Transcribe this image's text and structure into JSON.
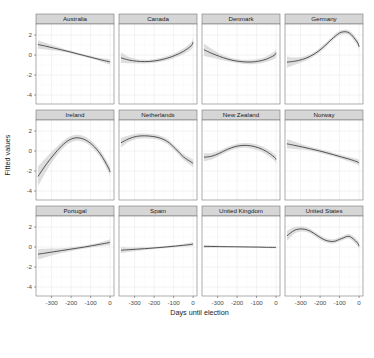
{
  "chart_data": {
    "type": "line",
    "title": "",
    "subtitle": "",
    "xlabel": "Days until election",
    "ylabel": "Fitted values",
    "xlim": [
      -380,
      20
    ],
    "ylim": [
      -4.9,
      3.1
    ],
    "xticks": [
      -300,
      -200,
      -100,
      0
    ],
    "xtick_labels": [
      "-300",
      "-200",
      "-100",
      "0"
    ],
    "yticks": [
      -4,
      -2,
      0,
      2
    ],
    "ytick_labels": [
      "-4",
      "-2",
      "0",
      "2"
    ],
    "grid": true,
    "legend": "none",
    "facet_layout": {
      "rows": 3,
      "cols": 4
    },
    "band_description": "shaded 95% confidence ribbon around each fitted smooth line",
    "line_color": "#3a3a3a",
    "ribbon_color": "#c9c9c9",
    "strip_color": "#d6d6d6",
    "panels": [
      {
        "name": "Australia",
        "row": 0,
        "col": 0,
        "x": [
          -370,
          -330,
          -290,
          -250,
          -210,
          -170,
          -130,
          -90,
          -50,
          -10,
          0
        ],
        "fit": [
          1.05,
          0.88,
          0.7,
          0.52,
          0.33,
          0.13,
          -0.07,
          -0.27,
          -0.47,
          -0.65,
          -0.7
        ],
        "lower": [
          0.62,
          0.55,
          0.46,
          0.34,
          0.19,
          0.0,
          -0.2,
          -0.41,
          -0.64,
          -0.9,
          -0.98
        ],
        "upper": [
          1.48,
          1.21,
          0.94,
          0.7,
          0.47,
          0.26,
          0.06,
          -0.13,
          -0.3,
          -0.4,
          -0.42
        ]
      },
      {
        "name": "Canada",
        "row": 0,
        "col": 1,
        "x": [
          -370,
          -330,
          -290,
          -250,
          -210,
          -170,
          -130,
          -90,
          -50,
          -10,
          0
        ],
        "fit": [
          -0.28,
          -0.5,
          -0.62,
          -0.66,
          -0.62,
          -0.5,
          -0.3,
          -0.02,
          0.36,
          0.92,
          1.3
        ],
        "lower": [
          -0.8,
          -0.82,
          -0.84,
          -0.84,
          -0.8,
          -0.7,
          -0.52,
          -0.26,
          0.08,
          0.56,
          0.86
        ],
        "upper": [
          0.24,
          -0.18,
          -0.4,
          -0.48,
          -0.44,
          -0.3,
          -0.08,
          0.22,
          0.64,
          1.28,
          1.74
        ]
      },
      {
        "name": "Denmark",
        "row": 0,
        "col": 2,
        "x": [
          -370,
          -330,
          -290,
          -250,
          -210,
          -170,
          -130,
          -90,
          -50,
          -10,
          0
        ],
        "fit": [
          0.52,
          0.16,
          -0.14,
          -0.4,
          -0.58,
          -0.68,
          -0.7,
          -0.62,
          -0.42,
          -0.04,
          0.22
        ],
        "lower": [
          -0.1,
          -0.28,
          -0.44,
          -0.62,
          -0.78,
          -0.88,
          -0.92,
          -0.86,
          -0.7,
          -0.4,
          -0.18
        ],
        "upper": [
          1.14,
          0.6,
          0.16,
          -0.18,
          -0.38,
          -0.48,
          -0.48,
          -0.38,
          -0.14,
          0.32,
          0.62
        ]
      },
      {
        "name": "Germany",
        "row": 0,
        "col": 3,
        "x": [
          -370,
          -330,
          -290,
          -250,
          -210,
          -170,
          -130,
          -90,
          -50,
          -10,
          0
        ],
        "fit": [
          -0.72,
          -0.62,
          -0.44,
          -0.12,
          0.36,
          1.02,
          1.76,
          2.28,
          2.2,
          1.3,
          0.82
        ],
        "lower": [
          -1.3,
          -0.98,
          -0.7,
          -0.34,
          0.14,
          0.8,
          1.54,
          2.06,
          1.96,
          1.0,
          0.48
        ],
        "upper": [
          -0.14,
          -0.26,
          -0.18,
          0.1,
          0.58,
          1.24,
          1.98,
          2.5,
          2.44,
          1.6,
          1.16
        ]
      },
      {
        "name": "Ireland",
        "row": 1,
        "col": 0,
        "x": [
          -370,
          -330,
          -290,
          -250,
          -210,
          -170,
          -130,
          -90,
          -50,
          -10,
          0
        ],
        "fit": [
          -2.55,
          -1.4,
          -0.4,
          0.48,
          1.1,
          1.32,
          1.14,
          0.6,
          -0.3,
          -1.62,
          -2.1
        ],
        "lower": [
          -3.55,
          -2.1,
          -0.9,
          0.1,
          0.78,
          1.02,
          0.84,
          0.28,
          -0.64,
          -2.05,
          -2.58
        ],
        "upper": [
          -1.55,
          -0.7,
          0.1,
          0.86,
          1.42,
          1.62,
          1.44,
          0.92,
          0.04,
          -1.19,
          -1.62
        ]
      },
      {
        "name": "Netherlands",
        "row": 1,
        "col": 1,
        "x": [
          -370,
          -330,
          -290,
          -250,
          -210,
          -170,
          -130,
          -90,
          -50,
          -10,
          0
        ],
        "fit": [
          0.82,
          1.22,
          1.46,
          1.52,
          1.46,
          1.3,
          0.92,
          0.22,
          -0.58,
          -1.1,
          -1.22
        ],
        "lower": [
          0.34,
          0.9,
          1.2,
          1.28,
          1.22,
          1.06,
          0.66,
          -0.04,
          -0.88,
          -1.46,
          -1.6
        ],
        "upper": [
          1.3,
          1.54,
          1.72,
          1.76,
          1.7,
          1.54,
          1.18,
          0.48,
          -0.28,
          -0.74,
          -0.84
        ]
      },
      {
        "name": "New Zealand",
        "row": 1,
        "col": 2,
        "x": [
          -370,
          -330,
          -290,
          -250,
          -210,
          -170,
          -130,
          -90,
          -50,
          -10,
          0
        ],
        "fit": [
          -0.62,
          -0.52,
          -0.22,
          0.16,
          0.44,
          0.56,
          0.52,
          0.32,
          -0.04,
          -0.6,
          -0.86
        ],
        "lower": [
          -1.02,
          -0.84,
          -0.48,
          -0.08,
          0.2,
          0.32,
          0.26,
          0.04,
          -0.34,
          -0.96,
          -1.26
        ],
        "upper": [
          -0.22,
          -0.2,
          0.04,
          0.4,
          0.68,
          0.8,
          0.78,
          0.6,
          0.26,
          -0.24,
          -0.46
        ]
      },
      {
        "name": "Norway",
        "row": 1,
        "col": 3,
        "x": [
          -370,
          -330,
          -290,
          -250,
          -210,
          -170,
          -130,
          -90,
          -50,
          -10,
          0
        ],
        "fit": [
          0.72,
          0.56,
          0.4,
          0.22,
          0.04,
          -0.16,
          -0.38,
          -0.6,
          -0.82,
          -1.08,
          -1.2
        ],
        "lower": [
          0.24,
          0.2,
          0.14,
          0.02,
          -0.14,
          -0.34,
          -0.56,
          -0.8,
          -1.04,
          -1.36,
          -1.52
        ],
        "upper": [
          1.2,
          0.92,
          0.66,
          0.42,
          0.22,
          0.02,
          -0.2,
          -0.4,
          -0.6,
          -0.8,
          -0.88
        ]
      },
      {
        "name": "Portugal",
        "row": 2,
        "col": 0,
        "x": [
          -370,
          -330,
          -290,
          -250,
          -210,
          -170,
          -130,
          -90,
          -50,
          -10,
          0
        ],
        "fit": [
          -0.72,
          -0.6,
          -0.48,
          -0.36,
          -0.24,
          -0.12,
          0.0,
          0.14,
          0.28,
          0.42,
          0.48
        ],
        "lower": [
          -1.24,
          -1.02,
          -0.8,
          -0.6,
          -0.44,
          -0.3,
          -0.16,
          -0.02,
          0.08,
          0.14,
          0.16
        ],
        "upper": [
          -0.2,
          -0.18,
          -0.16,
          -0.12,
          -0.04,
          0.06,
          0.16,
          0.3,
          0.48,
          0.7,
          0.8
        ]
      },
      {
        "name": "Spain",
        "row": 2,
        "col": 1,
        "x": [
          -370,
          -330,
          -290,
          -250,
          -210,
          -170,
          -130,
          -90,
          -50,
          -10,
          0
        ],
        "fit": [
          -0.32,
          -0.27,
          -0.22,
          -0.17,
          -0.11,
          -0.05,
          0.02,
          0.09,
          0.17,
          0.26,
          0.3
        ],
        "lower": [
          -0.62,
          -0.5,
          -0.4,
          -0.31,
          -0.23,
          -0.16,
          -0.09,
          -0.02,
          0.04,
          0.08,
          0.1
        ],
        "upper": [
          -0.02,
          -0.04,
          -0.04,
          -0.03,
          0.01,
          0.06,
          0.13,
          0.2,
          0.3,
          0.44,
          0.5
        ]
      },
      {
        "name": "United Kingdom",
        "row": 2,
        "col": 2,
        "x": [
          -370,
          -330,
          -290,
          -250,
          -210,
          -170,
          -130,
          -90,
          -50,
          -10,
          0
        ],
        "fit": [
          0.06,
          0.05,
          0.04,
          0.03,
          0.02,
          0.01,
          0.0,
          -0.01,
          -0.03,
          -0.04,
          -0.05
        ],
        "lower": [
          -0.1,
          -0.07,
          -0.05,
          -0.04,
          -0.03,
          -0.04,
          -0.05,
          -0.07,
          -0.09,
          -0.12,
          -0.13
        ],
        "upper": [
          0.22,
          0.17,
          0.13,
          0.1,
          0.07,
          0.06,
          0.05,
          0.05,
          0.03,
          0.04,
          0.03
        ]
      },
      {
        "name": "United States",
        "row": 2,
        "col": 3,
        "x": [
          -370,
          -330,
          -290,
          -250,
          -210,
          -170,
          -130,
          -90,
          -50,
          -10,
          0
        ],
        "fit": [
          1.12,
          1.68,
          1.8,
          1.58,
          1.08,
          0.66,
          0.56,
          0.84,
          1.06,
          0.44,
          0.08
        ],
        "lower": [
          0.62,
          1.36,
          1.56,
          1.36,
          0.86,
          0.44,
          0.34,
          0.62,
          0.82,
          0.14,
          -0.26
        ],
        "upper": [
          1.62,
          2.0,
          2.04,
          1.8,
          1.3,
          0.88,
          0.78,
          1.06,
          1.3,
          0.74,
          0.42
        ]
      }
    ]
  },
  "axis": {
    "ylabel": "Fitted values",
    "xlabel": "Days until election"
  }
}
